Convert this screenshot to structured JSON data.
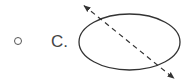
{
  "option": {
    "label": "C.",
    "selected": false
  },
  "figure": {
    "shape": "ellipse",
    "ellipse": {
      "cx": 129.5,
      "cy": 42,
      "rx": 50.5,
      "ry": 28,
      "stroke": "#333333"
    },
    "symmetry_line": {
      "x1": 82,
      "y1": 4,
      "x2": 176,
      "y2": 80,
      "style": "dashed",
      "arrowheads": "both",
      "stroke": "#333333"
    }
  }
}
